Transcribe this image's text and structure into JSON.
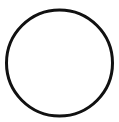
{
  "figure": {
    "shape": "circle",
    "icon": "circle-outline-icon",
    "stroke_color": "#111111",
    "fill_color": "#ffffff",
    "background_color": "#ffffff",
    "cx": 59.5,
    "cy": 63,
    "r": 53,
    "stroke_width": 3
  }
}
